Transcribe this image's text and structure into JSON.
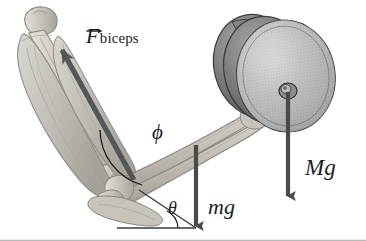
{
  "figure": {
    "type": "physics-free-body-diagram",
    "background_color": "#ffffff"
  },
  "labels": {
    "force_biceps": {
      "symbol": "F",
      "subscript": "biceps",
      "vector": true,
      "icon": "vector-arrow-accent"
    },
    "angle_phi": "ϕ",
    "angle_theta": "θ",
    "weight_arm": "mg",
    "weight_dumbbell": "Mg"
  },
  "colors": {
    "bone_fill": "#cdc9c0",
    "bone_edge": "#8a8780",
    "muscle_fill": "#c6c2bb",
    "muscle_edge": "#918d86",
    "plate_dark": "#6e6e6e",
    "plate_light": "#b4b4b4",
    "plate_edge": "#3d3d3d",
    "arrow": "#4a4a4a",
    "force_arrow": "#555555",
    "ink": "#1c1c1c",
    "baseline": "#3a3a3a"
  },
  "elements": {
    "humerus": "upper-arm-bone",
    "radius_ulna": "forearm-bones",
    "biceps_muscle": "biceps-brachii",
    "elbow_joint": "elbow-joint",
    "dumbbell": "weight-plate-stack",
    "dumbbell_hub": "center-hub",
    "baseline": "horizontal-reference-line",
    "phi_arc": "angle-arc-phi",
    "theta_arc": "angle-arc-theta",
    "force_vector": "biceps-force-vector",
    "mg_vector": "forearm-weight-vector",
    "Mg_vector": "dumbbell-weight-vector"
  }
}
